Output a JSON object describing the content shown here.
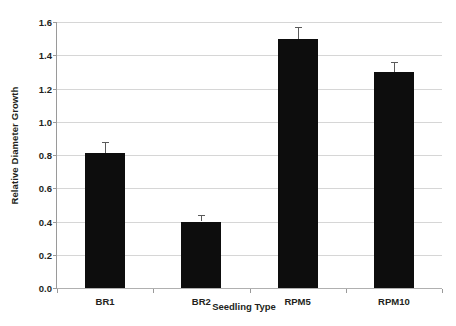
{
  "chart_data": {
    "type": "bar",
    "title": "",
    "categories": [
      "BR1",
      "BR2",
      "RPM5",
      "RPM10"
    ],
    "values": [
      0.81,
      0.4,
      1.5,
      1.3
    ],
    "errors": [
      0.07,
      0.04,
      0.07,
      0.06
    ],
    "xlabel": "Seedling Type",
    "ylabel": "Relative Diameter Growth",
    "ylim": [
      0.0,
      1.6
    ],
    "ytick_labels": [
      "0.0",
      "0.2",
      "0.4",
      "0.6",
      "0.8",
      "1.0",
      "1.2",
      "1.4",
      "1.6"
    ],
    "ytick_values": [
      0.0,
      0.2,
      0.4,
      0.6,
      0.8,
      1.0,
      1.2,
      1.4,
      1.6
    ],
    "grid": true,
    "legend": false,
    "bar_color": "#0d0d0d",
    "gridline_color": "#d6d6d6",
    "axis_color": "#9a9a9a",
    "error_bar_color": "#5a5a5a",
    "background_color": "#ffffff"
  }
}
